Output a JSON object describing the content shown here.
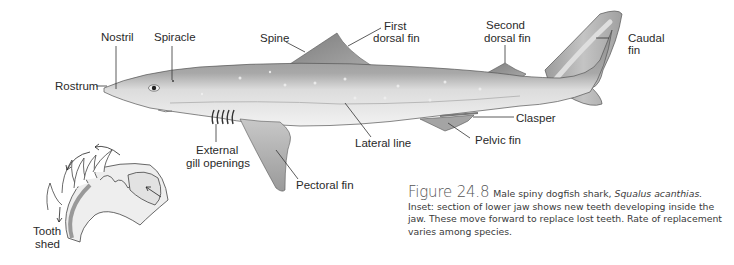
{
  "figure": {
    "number": "Figure 24.8",
    "caption_prefix": "Male spiny dogfish shark, ",
    "species": "Squalus acanthias.",
    "caption_rest": " Inset: section of lower jaw shows new teeth developing inside the jaw. These move forward to replace lost teeth. Rate of replacement varies among species."
  },
  "labels": {
    "nostril": "Nostril",
    "spiracle": "Spiracle",
    "rostrum": "Rostrum",
    "spine": "Spine",
    "first_dorsal_line1": "First",
    "first_dorsal_line2": "dorsal fin",
    "second_dorsal_line1": "Second",
    "second_dorsal_line2": "dorsal fin",
    "caudal_line1": "Caudal",
    "caudal_line2": "fin",
    "clasper": "Clasper",
    "pelvic_fin": "Pelvic fin",
    "lateral_line": "Lateral line",
    "gill_line1": "External",
    "gill_line2": "gill openings",
    "pectoral_fin": "Pectoral fin",
    "tooth_line1": "Tooth",
    "tooth_line2": "shed"
  },
  "colors": {
    "body_dark": "#8a8a8a",
    "body_light": "#e6e6e6",
    "fin": "#9a9a9a",
    "line": "#333333"
  }
}
